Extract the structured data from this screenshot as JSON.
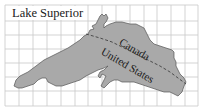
{
  "map": {
    "title": "Lake Superior",
    "labels": {
      "north": "Canada",
      "south": "United States"
    },
    "grid": {
      "columns": 14,
      "rows": 7,
      "line_color": "#c8c8c8"
    },
    "colors": {
      "water": "#a9a9a9",
      "outline": "#555555",
      "border_line": "#333333",
      "background": "#ffffff"
    },
    "features": [
      {
        "type": "lake",
        "name": "Lake Superior"
      },
      {
        "type": "international-border",
        "between": [
          "Canada",
          "United States"
        ],
        "style": "dashed"
      }
    ]
  }
}
